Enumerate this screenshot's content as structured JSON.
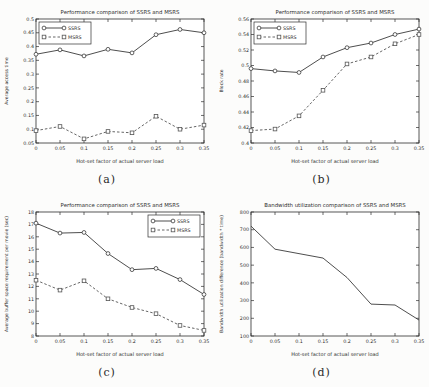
{
  "page": {
    "background": "#fcfcfb"
  },
  "colors": {
    "line": "#3a3a3a",
    "line_dashed": "#555555",
    "axis": "#2e2e2e",
    "text": "#2e2e2e",
    "plot_background": "#ffffff"
  },
  "chart_data": [
    {
      "id": "a",
      "type": "line",
      "title": "Performance comparison of SSRS and MSRS",
      "xlabel": "Hot-set factor of actual server load",
      "ylabel": "Average access time",
      "caption": "(a)",
      "x": [
        0,
        0.05,
        0.1,
        0.15,
        0.2,
        0.25,
        0.3,
        0.35
      ],
      "xlim": [
        0,
        0.35
      ],
      "ylim": [
        0.05,
        0.5
      ],
      "xticks": [
        "0",
        "0.05",
        "0.1",
        "0.15",
        "0.2",
        "0.25",
        "0.3",
        "0.35"
      ],
      "yticks": [
        "0.05",
        "0.1",
        "0.15",
        "0.2",
        "0.25",
        "0.3",
        "0.35",
        "0.4",
        "0.45",
        "0.5"
      ],
      "legend": {
        "visible": true,
        "position": "top-left"
      },
      "series": [
        {
          "name": "SSRS",
          "marker": "circle",
          "line": "solid",
          "values": [
            0.372,
            0.388,
            0.366,
            0.39,
            0.377,
            0.443,
            0.462,
            0.45
          ]
        },
        {
          "name": "MSRS",
          "marker": "square",
          "line": "dashed",
          "values": [
            0.095,
            0.11,
            0.065,
            0.092,
            0.087,
            0.147,
            0.1,
            0.115
          ]
        }
      ]
    },
    {
      "id": "b",
      "type": "line",
      "title": "Performance comparison of SSRS and MSRS",
      "xlabel": "Hot-set factor of actual server load",
      "ylabel": "Block rate",
      "caption": "(b)",
      "x": [
        0,
        0.05,
        0.1,
        0.15,
        0.2,
        0.25,
        0.3,
        0.35
      ],
      "xlim": [
        0,
        0.35
      ],
      "ylim": [
        0.4,
        0.56
      ],
      "xticks": [
        "0",
        "0.05",
        "0.1",
        "0.15",
        "0.2",
        "0.25",
        "0.3",
        "0.35"
      ],
      "yticks": [
        "0.4",
        "0.42",
        "0.44",
        "0.46",
        "0.48",
        "0.5",
        "0.52",
        "0.54",
        "0.56"
      ],
      "legend": {
        "visible": true,
        "position": "top-left"
      },
      "series": [
        {
          "name": "SSRS",
          "marker": "circle",
          "line": "solid",
          "values": [
            0.496,
            0.493,
            0.491,
            0.511,
            0.523,
            0.529,
            0.54,
            0.547
          ]
        },
        {
          "name": "MSRS",
          "marker": "square",
          "line": "dashed",
          "values": [
            0.416,
            0.418,
            0.435,
            0.468,
            0.502,
            0.511,
            0.528,
            0.54
          ]
        }
      ]
    },
    {
      "id": "c",
      "type": "line",
      "title": "Performance comparison of SSRS and MSRS",
      "xlabel": "Hot-set factor of actual server load",
      "ylabel": "Average buffer space requirement per movie (sec)",
      "caption": "(c)",
      "x": [
        0,
        0.05,
        0.1,
        0.15,
        0.2,
        0.25,
        0.3,
        0.35
      ],
      "xlim": [
        0,
        0.35
      ],
      "ylim": [
        8,
        18
      ],
      "xticks": [
        "0",
        "0.05",
        "0.1",
        "0.15",
        "0.2",
        "0.25",
        "0.3",
        "0.35"
      ],
      "yticks": [
        "8",
        "9",
        "10",
        "11",
        "12",
        "13",
        "14",
        "15",
        "16",
        "17",
        "18"
      ],
      "legend": {
        "visible": true,
        "position": "top-right"
      },
      "series": [
        {
          "name": "SSRS",
          "marker": "circle",
          "line": "solid",
          "values": [
            17.1,
            16.3,
            16.35,
            14.65,
            13.35,
            13.45,
            12.55,
            11.35
          ]
        },
        {
          "name": "MSRS",
          "marker": "square",
          "line": "dashed",
          "values": [
            12.5,
            11.7,
            12.45,
            11.0,
            10.3,
            9.8,
            8.85,
            8.45
          ]
        }
      ]
    },
    {
      "id": "d",
      "type": "line",
      "title": "Bandwidth utilization comparison of SSRS and MSRS",
      "xlabel": "Hot-set factor of actual server load",
      "ylabel": "Bandwidth utilization difference (bandwidth * time)",
      "caption": "(d)",
      "x": [
        0,
        0.05,
        0.1,
        0.15,
        0.2,
        0.25,
        0.3,
        0.35
      ],
      "xlim": [
        0,
        0.35
      ],
      "ylim": [
        100,
        800
      ],
      "xticks": [
        "0",
        "0.05",
        "0.1",
        "0.15",
        "0.2",
        "0.25",
        "0.3",
        "0.35"
      ],
      "yticks": [
        "100",
        "200",
        "300",
        "400",
        "500",
        "600",
        "700",
        "800"
      ],
      "legend": {
        "visible": false,
        "position": "none"
      },
      "series": [
        {
          "name": "SSRS-MSRS difference",
          "marker": "none",
          "line": "solid",
          "values": [
            720,
            590,
            565,
            540,
            430,
            280,
            275,
            190
          ]
        }
      ]
    }
  ]
}
